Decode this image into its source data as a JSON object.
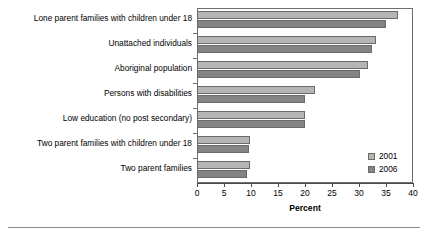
{
  "chart_data": {
    "type": "bar",
    "orientation": "horizontal",
    "title": "",
    "xlabel": "Percent",
    "ylabel": "",
    "xlim": [
      0,
      40
    ],
    "xticks": [
      0,
      5,
      10,
      15,
      20,
      25,
      30,
      35,
      40
    ],
    "grid": false,
    "legend_position": "inside-bottom-right",
    "categories": [
      "Lone parent families with children under 18",
      "Unattached individuals",
      "Aboriginal population",
      "Persons with disabilities",
      "Low education (no post secondary)",
      "Two parent families with children under 18",
      "Two parent families"
    ],
    "series": [
      {
        "name": "2001",
        "color": "#b5b5b5",
        "values": [
          37.2,
          33.1,
          31.6,
          21.9,
          20.0,
          9.8,
          9.8
        ]
      },
      {
        "name": "2006",
        "color": "#848484",
        "values": [
          35.0,
          32.4,
          30.2,
          20.0,
          20.0,
          9.6,
          9.3
        ]
      }
    ]
  },
  "legend": {
    "entries": [
      {
        "label": "2001",
        "color": "#b5b5b5"
      },
      {
        "label": "2006",
        "color": "#848484"
      }
    ]
  },
  "axis": {
    "x_title": "Percent",
    "tick_labels": [
      "0",
      "5",
      "10",
      "15",
      "20",
      "25",
      "30",
      "35",
      "40"
    ]
  },
  "colors": {
    "series_2001": "#b5b5b5",
    "series_2006": "#848484",
    "frame": "#6f6f6f",
    "axis": "#4a4a4a",
    "rule": "#8a8a8a",
    "background": "#ffffff"
  }
}
